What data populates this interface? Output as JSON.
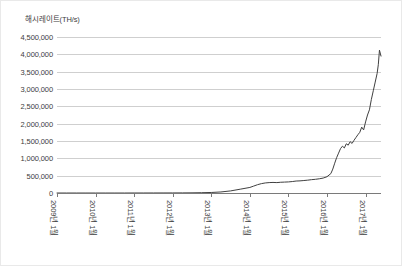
{
  "chart_data": {
    "type": "line",
    "title": "해시레이트(TH/s)",
    "xlabel": "",
    "ylabel": "해시레이트(TH/s)",
    "ylim": [
      0,
      4500000
    ],
    "yticks": [
      0,
      500000,
      1000000,
      1500000,
      2000000,
      2500000,
      3000000,
      3500000,
      4000000,
      4500000
    ],
    "ytick_labels": [
      "0",
      "500,000",
      "1,000,000",
      "1,500,000",
      "2,000,000",
      "2,500,000",
      "3,000,000",
      "3,500,000",
      "4,000,000",
      "4,500,000"
    ],
    "xtick_labels": [
      "2009년 1월",
      "2010년 1월",
      "2011년 1월",
      "2012년 1월",
      "2013년 1월",
      "2014년 1월",
      "2015년 1월",
      "2016년 1월",
      "2017년 1월"
    ],
    "grid": true,
    "legend": "none",
    "line_color": "#404040",
    "grid_color": "#cfcfcf",
    "axis_color": "#7a7a7a",
    "series": [
      {
        "name": "해시레이트",
        "x": [
          2009.0,
          2009.25,
          2009.5,
          2009.75,
          2010.0,
          2010.25,
          2010.5,
          2010.75,
          2011.0,
          2011.25,
          2011.5,
          2011.75,
          2012.0,
          2012.25,
          2012.5,
          2012.75,
          2013.0,
          2013.25,
          2013.5,
          2013.75,
          2014.0,
          2014.1,
          2014.2,
          2014.3,
          2014.4,
          2014.5,
          2014.6,
          2014.7,
          2014.8,
          2014.9,
          2015.0,
          2015.1,
          2015.2,
          2015.3,
          2015.4,
          2015.5,
          2015.6,
          2015.7,
          2015.8,
          2015.9,
          2016.0,
          2016.1,
          2016.15,
          2016.2,
          2016.25,
          2016.3,
          2016.35,
          2016.4,
          2016.45,
          2016.5,
          2016.55,
          2016.6,
          2016.65,
          2016.7,
          2016.75,
          2016.8,
          2016.85,
          2016.9,
          2016.95,
          2017.0,
          2017.05,
          2017.1,
          2017.15,
          2017.2,
          2017.25,
          2017.3,
          2017.33,
          2017.36,
          2017.4
        ],
        "y": [
          0,
          0,
          0,
          0,
          0,
          0,
          0,
          0,
          500,
          900,
          1200,
          1500,
          2000,
          3000,
          5000,
          9000,
          15000,
          30000,
          60000,
          110000,
          160000,
          200000,
          240000,
          270000,
          290000,
          300000,
          305000,
          300000,
          310000,
          315000,
          320000,
          330000,
          345000,
          350000,
          360000,
          370000,
          385000,
          395000,
          410000,
          430000,
          470000,
          560000,
          690000,
          860000,
          1020000,
          1150000,
          1280000,
          1350000,
          1300000,
          1420000,
          1380000,
          1480000,
          1430000,
          1520000,
          1600000,
          1680000,
          1750000,
          1900000,
          1820000,
          2050000,
          2250000,
          2400000,
          2700000,
          2950000,
          3200000,
          3450000,
          3700000,
          4120000,
          3950000
        ]
      }
    ]
  }
}
